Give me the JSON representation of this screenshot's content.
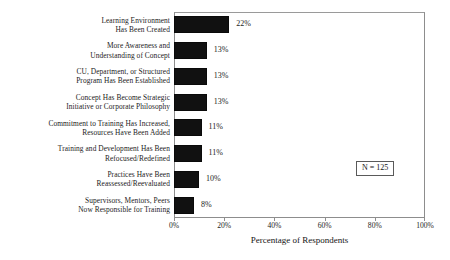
{
  "chart_data": {
    "type": "bar",
    "orientation": "horizontal",
    "title": "",
    "xlabel": "Percentage of Respondents",
    "ylabel": "",
    "xlim": [
      0,
      100
    ],
    "grid": false,
    "legend": null,
    "annotation": "N = 125",
    "xticks": [
      "0%",
      "20%",
      "40%",
      "60%",
      "80%",
      "100%"
    ],
    "xtick_values": [
      0,
      20,
      40,
      60,
      80,
      100
    ],
    "categories": [
      "Learning Environment Has Been Created",
      "More Awareness and Understanding of Concept",
      "CU, Department, or Structured Program Has Been Established",
      "Concept Has Become Strategic Initiative or Corporate Philosophy",
      "Commitment to Training Has Increased, Resources Have Been Added",
      "Training and Development Has Been Refocused/Redefined",
      "Practices Have Been Reassessed/Reevaluated",
      "Supervisors, Mentors, Peers Now Responsible for Training"
    ],
    "values": [
      22,
      13,
      13,
      13,
      11,
      11,
      10,
      8
    ],
    "value_labels": [
      "22%",
      "13%",
      "13%",
      "13%",
      "11%",
      "11%",
      "10%",
      "8%"
    ],
    "bar_color": "#111111",
    "frame_color": "#8d8d8d",
    "bars": [
      {
        "label_lines": [
          "Learning Environment",
          "Has Been Created"
        ],
        "value": 22,
        "value_label": "22%"
      },
      {
        "label_lines": [
          "More Awareness and",
          "Understanding of Concept"
        ],
        "value": 13,
        "value_label": "13%"
      },
      {
        "label_lines": [
          "CU, Department, or Structured",
          "Program Has Been Established"
        ],
        "value": 13,
        "value_label": "13%"
      },
      {
        "label_lines": [
          "Concept Has Become Strategic",
          "Initiative or Corporate Philosophy"
        ],
        "value": 13,
        "value_label": "13%"
      },
      {
        "label_lines": [
          "Commitment to Training Has Increased,",
          "Resources Have Been Added"
        ],
        "value": 11,
        "value_label": "11%"
      },
      {
        "label_lines": [
          "Training and Development Has Been",
          "Refocused/Redefined"
        ],
        "value": 11,
        "value_label": "11%"
      },
      {
        "label_lines": [
          "Practices Have Been",
          "Reassessed/Reevaluated"
        ],
        "value": 10,
        "value_label": "10%"
      },
      {
        "label_lines": [
          "Supervisors, Mentors, Peers",
          "Now Responsible for Training"
        ],
        "value": 8,
        "value_label": "8%"
      }
    ]
  }
}
